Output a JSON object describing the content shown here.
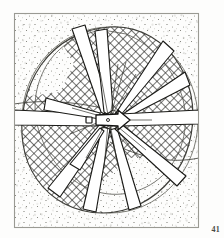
{
  "figure": {
    "plate_number": "41",
    "medium": "ink line drawing, stipple and crosshatch",
    "frame": {
      "border_color": "#9a9a93",
      "border_width_px": 1,
      "left": 14,
      "top": 13,
      "right": 199,
      "bottom": 228
    },
    "background": {
      "paper_color": "#fdfdfc",
      "stipple_color": "#7d7d76",
      "stipple_description": "fine scattered dot texture filling frame outside the disc"
    },
    "disc": {
      "description": "large irregular circular outline occupying most of the frame",
      "center_x": 110,
      "center_y": 120,
      "radius_x": 88,
      "radius_y": 93,
      "outline_color": "#4b4b46",
      "outline_width_px": 1
    },
    "mesh_field": {
      "description": "crosshatched diagonal lattice infill covering the disc interior",
      "hatch_color": "#2e2e2b",
      "hatch_spacing_px": 6,
      "hatch_angles_deg": [
        45,
        -45
      ]
    },
    "spokes": {
      "description": "white tapered blade-like spokes radiating from the central hub over the mesh",
      "count": 11,
      "fill_color": "#ffffff",
      "outline_color": "#1e1e1c",
      "angles_deg": [
        -104,
        -74,
        -40,
        -8,
        12,
        40,
        68,
        96,
        124,
        152,
        180
      ]
    },
    "hub": {
      "description": "small key-shaped or arrow-shaped central fitting at the axis",
      "shape": "keyhole-arrow",
      "fill_color": "#ffffff",
      "outline_color": "#141413",
      "center_x": 110,
      "center_y": 120,
      "width_px": 26,
      "height_px": 12
    },
    "rays": {
      "description": "fine short radiating hairlines emanating from the hub",
      "count": 16,
      "color": "#35352f"
    }
  },
  "icons": {
    "plate_label": "plate-number-41"
  }
}
